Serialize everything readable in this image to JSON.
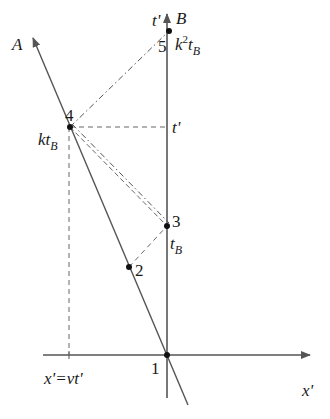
{
  "diagram": {
    "type": "spacetime-diagram",
    "colors": {
      "line": "#555555",
      "text": "#1a1a1a",
      "point": "#111111",
      "background": "#ffffff"
    },
    "axes": {
      "vertical": {
        "label_top_left": "t'",
        "label_top_right": "B"
      },
      "horizontal": {
        "label": "x'"
      },
      "worldline_A": {
        "label": "A"
      }
    },
    "points": [
      {
        "id": "1",
        "label": "1"
      },
      {
        "id": "2",
        "label": "2"
      },
      {
        "id": "3",
        "label": "3",
        "annotation_base": "t",
        "annotation_sub": "B"
      },
      {
        "id": "4",
        "label": "4",
        "annotation_base": "kt",
        "annotation_sub": "B"
      },
      {
        "id": "5",
        "label": "5",
        "annotation_base": "k",
        "annotation_sup": "2",
        "annotation_base2": "t",
        "annotation_sub": "B"
      }
    ],
    "projections": {
      "time_label": "t'",
      "position_label": "x'=vt'"
    }
  }
}
